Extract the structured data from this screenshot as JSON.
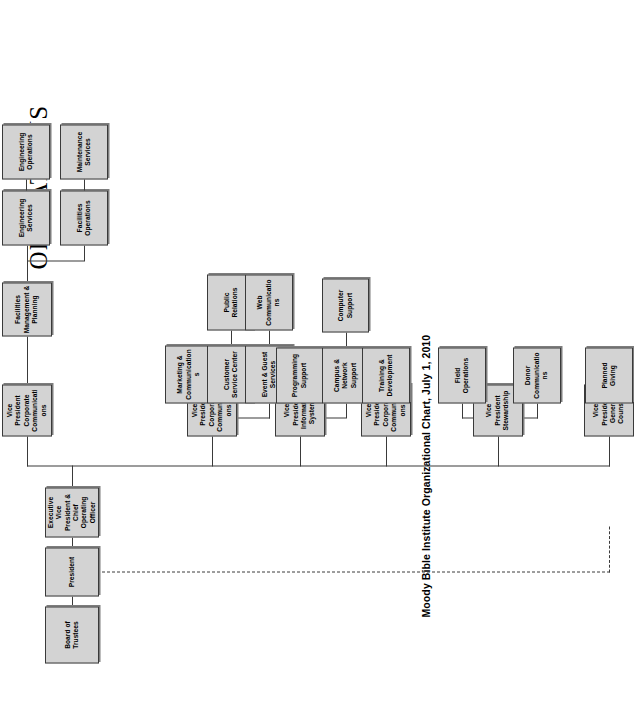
{
  "document": {
    "title": "OPERATIONS",
    "caption": "Moody Bible Institute Organizational Chart, July 1, 2010",
    "orientation": "rotated-90-ccw",
    "colors": {
      "box_fill": "#d3d3d3",
      "box_border": "#3a3a3a",
      "background": "#ffffff",
      "connector": "#3a3a3a"
    }
  },
  "chart_data": {
    "type": "diagram",
    "subtype": "organizational-chart",
    "title": "OPERATIONS",
    "caption": "Moody Bible Institute Organizational Chart, July 1, 2010",
    "nodes": [
      {
        "id": "board",
        "label": "Board of Trustees",
        "level": 0
      },
      {
        "id": "president",
        "label": "President",
        "level": 1
      },
      {
        "id": "evp",
        "label": "Executive\nVice President &\nChief Operating\nOfficer",
        "level": 2
      },
      {
        "id": "vp_fac",
        "label": "Vice President\nCorporate\nCommunications",
        "level": 3
      },
      {
        "id": "vp_comm",
        "label": "Vice President\nCorporate\nCommunications",
        "level": 3
      },
      {
        "id": "vp_is",
        "label": "Vice President\nInformation\nSystems",
        "level": 3
      },
      {
        "id": "vp_corp",
        "label": "Vice President\nCorporate\nCommunications",
        "level": 3
      },
      {
        "id": "vp_stew",
        "label": "Vice President\nStewardship",
        "level": 3
      },
      {
        "id": "vp_gc",
        "label": "Vice President\nGeneral\nCounsel",
        "level": 3
      },
      {
        "id": "fmp",
        "label": "Facilities\nManagement &\nPlanning",
        "level": 4
      },
      {
        "id": "eng_svc",
        "label": "Engineering\nServices",
        "level": 5
      },
      {
        "id": "eng_ops",
        "label": "Engineering\nOperations",
        "level": 5
      },
      {
        "id": "fac_ops",
        "label": "Facilities\nOperations",
        "level": 5
      },
      {
        "id": "maint_svc",
        "label": "Maintenance\nServices",
        "level": 5
      },
      {
        "id": "mkt_comm",
        "label": "Marketing &\nCommunications",
        "level": 4
      },
      {
        "id": "cust_svc",
        "label": "Customer\nService Center",
        "level": 4
      },
      {
        "id": "event_guest",
        "label": "Event & Guest\nServices",
        "level": 4
      },
      {
        "id": "pub_rel",
        "label": "Public\nRelations",
        "level": 5
      },
      {
        "id": "web_comm",
        "label": "Web\nCommunications",
        "level": 5
      },
      {
        "id": "prog_supp",
        "label": "Programming\nSupport",
        "level": 4
      },
      {
        "id": "campus_net",
        "label": "Campus &\nNetwork\nSupport",
        "level": 4
      },
      {
        "id": "comp_supp",
        "label": "Computer\nSupport",
        "level": 5
      },
      {
        "id": "train_dev",
        "label": "Training &\nDevelopment",
        "level": 4
      },
      {
        "id": "field_ops",
        "label": "Field\nOperations",
        "level": 4
      },
      {
        "id": "donor_comm",
        "label": "Donor\nCommunications",
        "level": 4
      },
      {
        "id": "planned_give",
        "label": "Planned\nGiving",
        "level": 4
      }
    ],
    "edges": [
      {
        "from": "board",
        "to": "president",
        "style": "solid"
      },
      {
        "from": "president",
        "to": "evp",
        "style": "solid"
      },
      {
        "from": "president",
        "to": "vp_gc",
        "style": "dashed"
      },
      {
        "from": "evp",
        "to": "vp_fac",
        "style": "solid"
      },
      {
        "from": "evp",
        "to": "vp_comm",
        "style": "solid"
      },
      {
        "from": "evp",
        "to": "vp_is",
        "style": "solid"
      },
      {
        "from": "evp",
        "to": "vp_corp",
        "style": "solid"
      },
      {
        "from": "evp",
        "to": "vp_stew",
        "style": "solid"
      },
      {
        "from": "vp_fac",
        "to": "fmp",
        "style": "solid"
      },
      {
        "from": "fmp",
        "to": "eng_svc",
        "style": "solid"
      },
      {
        "from": "fmp",
        "to": "eng_ops",
        "style": "solid"
      },
      {
        "from": "fmp",
        "to": "fac_ops",
        "style": "solid"
      },
      {
        "from": "fmp",
        "to": "maint_svc",
        "style": "solid"
      },
      {
        "from": "vp_comm",
        "to": "mkt_comm",
        "style": "solid"
      },
      {
        "from": "vp_comm",
        "to": "cust_svc",
        "style": "solid"
      },
      {
        "from": "vp_comm",
        "to": "event_guest",
        "style": "solid"
      },
      {
        "from": "cust_svc",
        "to": "pub_rel",
        "style": "solid"
      },
      {
        "from": "event_guest",
        "to": "web_comm",
        "style": "solid"
      },
      {
        "from": "vp_is",
        "to": "prog_supp",
        "style": "solid"
      },
      {
        "from": "vp_is",
        "to": "campus_net",
        "style": "solid"
      },
      {
        "from": "campus_net",
        "to": "comp_supp",
        "style": "solid"
      },
      {
        "from": "vp_corp",
        "to": "train_dev",
        "style": "solid"
      },
      {
        "from": "vp_stew",
        "to": "field_ops",
        "style": "solid"
      },
      {
        "from": "vp_stew",
        "to": "donor_comm",
        "style": "solid"
      },
      {
        "from": "vp_gc",
        "to": "planned_give",
        "style": "solid"
      }
    ]
  }
}
